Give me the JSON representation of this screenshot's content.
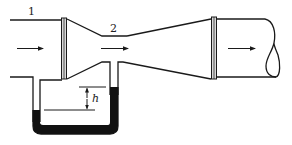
{
  "diagram": {
    "labels": {
      "section_1": "1",
      "section_2": "2",
      "height_diff": "h"
    },
    "colors": {
      "line": "#1a1a1a",
      "manometer_fluid": "#111111",
      "flange_fill": "#d8d8d8",
      "background": "#ffffff"
    },
    "components": [
      {
        "name": "upstream pipe",
        "section": "1"
      },
      {
        "name": "inlet flange"
      },
      {
        "name": "converging cone"
      },
      {
        "name": "throat",
        "section": "2"
      },
      {
        "name": "diverging cone"
      },
      {
        "name": "outlet flange"
      },
      {
        "name": "downstream pipe with break symbol"
      },
      {
        "name": "U-tube manometer",
        "reading": "h"
      }
    ],
    "flow_direction": "left-to-right"
  }
}
